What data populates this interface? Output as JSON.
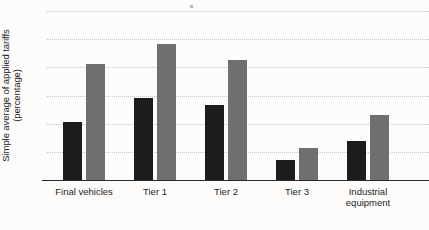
{
  "chart_data": {
    "type": "bar",
    "title": "",
    "xlabel": "",
    "ylabel": "Simple average of applied tariffs (percentage)",
    "ylabel_line1": "Simple average of applied tariffs",
    "ylabel_line2": "(percentage)",
    "categories": [
      "Final vehicles",
      "Tier 1",
      "Tier 2",
      "Tier 3",
      "Industrial equipment"
    ],
    "category_labels_display": [
      "Final vehicles",
      "Tier 1",
      "Tier 2",
      "Tier 3",
      "Industrial\nequipment"
    ],
    "series": [
      {
        "name": "series-1",
        "color": "#1c1c1c",
        "values": [
          4.15,
          5.8,
          5.3,
          1.4,
          2.8
        ]
      },
      {
        "name": "series-2",
        "color": "#6f6f6f",
        "values": [
          8.25,
          9.65,
          8.5,
          2.25,
          4.6
        ]
      }
    ],
    "ylim": [
      0,
      12
    ],
    "yticks": [
      0,
      2,
      4,
      6,
      8,
      10,
      12
    ],
    "ytick_labels": [
      "0",
      "2",
      "4",
      "6",
      "8",
      "10",
      "12"
    ],
    "grid": true,
    "grid_style": "dotted",
    "grid_color": "#c9c6c0",
    "legend": false,
    "legend_position": "none",
    "background_color": "#fdfcfa",
    "axis_color": "#2a2a2a"
  }
}
